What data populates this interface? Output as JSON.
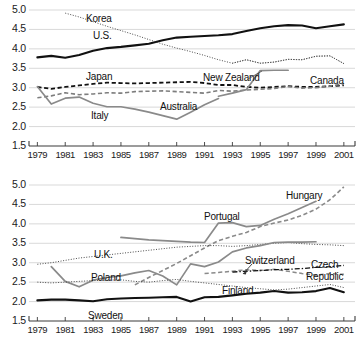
{
  "figure": {
    "width": 361,
    "height": 350,
    "background": "#ffffff",
    "panel_count": 2
  },
  "axis_style": {
    "gridline_color": "#cfcfcf",
    "axis_color": "#3a3a3a",
    "tick_color": "#3a3a3a",
    "text_color": "#1a1a1a"
  },
  "chart_data": [
    {
      "type": "line",
      "panel": "top",
      "title": "",
      "xlabel": "",
      "ylabel": "",
      "xlim": [
        1978.4,
        2001.8
      ],
      "ylim": [
        1.5,
        5.0
      ],
      "yticks": [
        "1.5",
        "2.0",
        "2.5",
        "3.0",
        "3.5",
        "4.0",
        "4.5",
        "5.0"
      ],
      "ytick_values": [
        1.5,
        2.0,
        2.5,
        3.0,
        3.5,
        4.0,
        4.5,
        5.0
      ],
      "xticks": [
        "1979",
        "1981",
        "1983",
        "1985",
        "1987",
        "1989",
        "1991",
        "1993",
        "1995",
        "1997",
        "1999",
        "2001"
      ],
      "xtick_values": [
        1979,
        1981,
        1983,
        1985,
        1987,
        1989,
        1991,
        1993,
        1995,
        1997,
        1999,
        2001
      ],
      "grid": true,
      "legend": "inline-labels",
      "series": [
        {
          "name": "U.S.",
          "style": "solid",
          "color": "#111111",
          "width": 2.1,
          "x": [
            1979,
            1980,
            1981,
            1982,
            1983,
            1984,
            1985,
            1986,
            1987,
            1988,
            1989,
            1990,
            1991,
            1992,
            1993,
            1994,
            1995,
            1996,
            1997,
            1998,
            1999,
            2000,
            2001
          ],
          "values": [
            3.78,
            3.82,
            3.77,
            3.84,
            3.95,
            4.02,
            4.05,
            4.09,
            4.13,
            4.22,
            4.29,
            4.31,
            4.33,
            4.35,
            4.38,
            4.46,
            4.53,
            4.58,
            4.61,
            4.6,
            4.53,
            4.58,
            4.63
          ]
        },
        {
          "name": "Korea",
          "style": "dotted",
          "color": "#4d4d4d",
          "width": 1.0,
          "x": [
            1981,
            1982,
            1983,
            1984,
            1985,
            1986,
            1987,
            1988,
            1989,
            1990,
            1991,
            1992,
            1993,
            1994,
            1995,
            1996,
            1997,
            1998,
            1999,
            2000,
            2001
          ],
          "values": [
            4.92,
            4.82,
            4.7,
            4.58,
            4.47,
            4.36,
            4.24,
            4.12,
            4.02,
            3.93,
            3.83,
            3.72,
            3.63,
            3.72,
            3.63,
            3.66,
            3.73,
            3.72,
            3.81,
            3.82,
            3.62
          ]
        },
        {
          "name": "Canada",
          "style": "dotted",
          "color": "#4d4d4d",
          "width": 1.0,
          "x": [
            1993,
            1994,
            1995,
            1996,
            1997,
            1998,
            1999,
            2000,
            2001
          ],
          "values": [
            3.63,
            3.72,
            3.63,
            3.66,
            3.73,
            3.72,
            3.81,
            3.82,
            3.62
          ]
        },
        {
          "name": "Japan",
          "style": "dashed",
          "color": "#111111",
          "width": 1.8,
          "x": [
            1979,
            1980,
            1981,
            1982,
            1983,
            1984,
            1985,
            1986,
            1987,
            1988,
            1989,
            1990,
            1991,
            1992,
            1993,
            1994,
            1995,
            1996,
            1997,
            1998,
            1999,
            2000,
            2001
          ],
          "values": [
            3.02,
            2.97,
            3.02,
            3.06,
            3.1,
            3.13,
            3.12,
            3.11,
            3.12,
            3.13,
            3.14,
            3.15,
            3.12,
            3.07,
            3.07,
            3.02,
            3.0,
            3.02,
            3.04,
            3.02,
            3.02,
            3.04,
            3.06
          ]
        },
        {
          "name": "Australia",
          "style": "dashed",
          "color": "#7d7d7d",
          "width": 1.6,
          "x": [
            1979,
            1980,
            1981,
            1982,
            1983,
            1984,
            1985,
            1986,
            1987,
            1988,
            1989,
            1990,
            1991,
            1992,
            1993,
            1994,
            1995,
            1996,
            1997,
            1998,
            1999,
            2000,
            2001
          ],
          "values": [
            2.74,
            2.79,
            2.87,
            2.82,
            2.84,
            2.87,
            2.86,
            2.9,
            2.91,
            2.92,
            2.9,
            2.88,
            2.86,
            2.93,
            2.91,
            2.94,
            2.96,
            2.98,
            3.03,
            2.99,
            3.0,
            3.04,
            3.1
          ]
        },
        {
          "name": "Italy",
          "style": "solid",
          "color": "#8a8a8a",
          "width": 1.7,
          "x": [
            1979,
            1980,
            1981,
            1982,
            1983,
            1984,
            1985,
            1986,
            1987,
            1988,
            1989,
            1990,
            1991,
            1992
          ],
          "values": [
            3.03,
            2.58,
            2.73,
            2.76,
            2.6,
            2.51,
            2.51,
            2.45,
            2.37,
            2.28,
            2.19,
            2.37,
            2.56,
            2.72
          ]
        },
        {
          "name": "New Zealand",
          "style": "solid",
          "color": "#8a8a8a",
          "width": 1.7,
          "x": [
            1992,
            1993,
            1994,
            1995,
            1996,
            1997
          ],
          "values": [
            2.78,
            2.86,
            2.95,
            3.44,
            3.45,
            3.45
          ]
        }
      ],
      "annotations": [
        {
          "text": "Korea",
          "x_px": 86,
          "y_px": 13
        },
        {
          "text": "U.S.",
          "x_px": 93,
          "y_px": 30
        },
        {
          "text": "Japan",
          "x_px": 86,
          "y_px": 71
        },
        {
          "text": "New Zealand",
          "x_px": 203,
          "y_px": 72
        },
        {
          "text": "Canada",
          "x_px": 310,
          "y_px": 75
        },
        {
          "text": "Australia",
          "x_px": 160,
          "y_px": 101
        },
        {
          "text": "Italy",
          "x_px": 91,
          "y_px": 110
        }
      ]
    },
    {
      "type": "line",
      "panel": "bottom",
      "title": "",
      "xlabel": "",
      "ylabel": "",
      "xlim": [
        1978.4,
        2001.8
      ],
      "ylim": [
        1.5,
        5.0
      ],
      "yticks": [
        "1.5",
        "2.0",
        "2.5",
        "3.0",
        "3.5",
        "4.0",
        "4.5",
        "5.0"
      ],
      "ytick_values": [
        1.5,
        2.0,
        2.5,
        3.0,
        3.5,
        4.0,
        4.5,
        5.0
      ],
      "xticks": [
        "1979",
        "1981",
        "1983",
        "1985",
        "1987",
        "1989",
        "1991",
        "1993",
        "1995",
        "1997",
        "1999",
        "2001"
      ],
      "xtick_values": [
        1979,
        1981,
        1983,
        1985,
        1987,
        1989,
        1991,
        1993,
        1995,
        1997,
        1999,
        2001
      ],
      "grid": true,
      "legend": "inline-labels",
      "series": [
        {
          "name": "Hungary",
          "style": "dashed",
          "color": "#8a8a8a",
          "width": 1.6,
          "x": [
            1986,
            1987,
            1988,
            1989,
            1990,
            1991,
            1992,
            1993,
            1994,
            1995,
            1996,
            1997,
            1998,
            1999,
            2000,
            2001
          ],
          "values": [
            2.43,
            2.62,
            2.8,
            2.98,
            3.18,
            3.38,
            3.57,
            3.68,
            3.78,
            3.93,
            4.02,
            4.1,
            4.22,
            4.38,
            4.62,
            4.95
          ]
        },
        {
          "name": "Portugal",
          "style": "solid",
          "color": "#8a8a8a",
          "width": 1.7,
          "x": [
            1985,
            1986,
            1987,
            1988,
            1989,
            1990,
            1991,
            1992,
            1993,
            1994,
            1995,
            1996,
            1997,
            1998,
            1999
          ],
          "values": [
            3.65,
            3.62,
            3.59,
            3.57,
            3.55,
            3.53,
            3.52,
            4.02,
            4.03,
            3.93,
            3.96,
            4.12,
            4.26,
            4.42,
            4.58
          ]
        },
        {
          "name": "U.K.",
          "style": "dotted",
          "color": "#4d4d4d",
          "width": 1.0,
          "x": [
            1979,
            1980,
            1981,
            1982,
            1983,
            1984,
            1985,
            1986,
            1987,
            1988,
            1989,
            1990,
            1991,
            1992,
            1993,
            1994,
            1995,
            1996,
            1997,
            1998,
            1999,
            2000,
            2001
          ],
          "values": [
            2.96,
            3.0,
            3.06,
            3.12,
            3.16,
            3.2,
            3.24,
            3.28,
            3.32,
            3.36,
            3.4,
            3.42,
            3.44,
            3.44,
            3.42,
            3.44,
            3.47,
            3.5,
            3.52,
            3.49,
            3.47,
            3.46,
            3.44
          ]
        },
        {
          "name": "Poland",
          "style": "solid",
          "color": "#8a8a8a",
          "width": 1.7,
          "x": [
            1980,
            1981,
            1982,
            1983,
            1984,
            1985,
            1986,
            1987,
            1988,
            1989,
            1990,
            1991,
            1992,
            1993,
            1994,
            1995,
            1996,
            1997,
            1998,
            1999
          ],
          "values": [
            2.9,
            2.52,
            2.38,
            2.55,
            2.62,
            2.66,
            2.74,
            2.8,
            2.66,
            2.43,
            2.97,
            2.9,
            3.02,
            3.28,
            3.38,
            3.44,
            3.52,
            3.53,
            3.53,
            3.54
          ]
        },
        {
          "name": "Sweden",
          "style": "solid",
          "color": "#111111",
          "width": 2.1,
          "x": [
            1979,
            1980,
            1981,
            1982,
            1983,
            1984,
            1985,
            1986,
            1987,
            1988,
            1989,
            1990,
            1991,
            1992,
            1993,
            1994,
            1995,
            1996,
            1997,
            1998,
            1999,
            2000,
            2001
          ],
          "values": [
            2.03,
            2.05,
            2.05,
            2.03,
            2.01,
            2.06,
            2.08,
            2.09,
            2.1,
            2.11,
            2.12,
            2.0,
            2.11,
            2.12,
            2.16,
            2.2,
            2.23,
            2.27,
            2.23,
            2.24,
            2.27,
            2.35,
            2.24
          ]
        },
        {
          "name": "Finland",
          "style": "dotted",
          "color": "#4d4d4d",
          "width": 1.0,
          "x": [
            1979,
            1980,
            1981,
            1982,
            1983,
            1984,
            1985,
            1986,
            1987,
            1988,
            1989,
            1990,
            1991,
            1992,
            1993,
            1994,
            1995,
            1996,
            1997,
            1998,
            1999,
            2000,
            2001
          ],
          "values": [
            2.5,
            2.48,
            2.5,
            2.52,
            2.54,
            2.55,
            2.56,
            2.52,
            2.5,
            2.54,
            2.57,
            2.52,
            2.48,
            2.44,
            2.4,
            2.36,
            2.33,
            2.3,
            2.32,
            2.36,
            2.4,
            2.44,
            2.36
          ]
        },
        {
          "name": "Switzerland",
          "style": "dashed",
          "color": "#8a8a8a",
          "width": 1.5,
          "x": [
            1991,
            1992,
            1993,
            1994,
            1995,
            1996,
            1997,
            1998,
            1999,
            2000,
            2001
          ],
          "values": [
            2.72,
            2.75,
            2.78,
            2.82,
            2.8,
            2.83,
            2.78,
            2.72,
            2.68,
            2.72,
            2.7
          ]
        },
        {
          "name": "Czech Republic",
          "style": "dashdot",
          "color": "#111111",
          "width": 1.3,
          "x": [
            1993,
            1994,
            1995,
            1996,
            1997,
            1998,
            1999,
            2000,
            2001
          ],
          "values": [
            2.76,
            2.78,
            2.8,
            2.82,
            2.83,
            2.85,
            2.88,
            2.9,
            2.93
          ]
        }
      ],
      "annotations": [
        {
          "text": "Hungary",
          "x_px": 286,
          "y_px": 190
        },
        {
          "text": "Portugal",
          "x_px": 204,
          "y_px": 211
        },
        {
          "text": "U.K.",
          "x_px": 94,
          "y_px": 249
        },
        {
          "text": "Poland",
          "x_px": 91,
          "y_px": 272
        },
        {
          "text": "Switzerland",
          "x_px": 245,
          "y_px": 255
        },
        {
          "text": "Czech",
          "x_px": 311,
          "y_px": 259
        },
        {
          "text": "Republic",
          "x_px": 306,
          "y_px": 271
        },
        {
          "text": "Finland",
          "x_px": 222,
          "y_px": 285
        },
        {
          "text": "Sweden",
          "x_px": 88,
          "y_px": 310
        }
      ]
    }
  ]
}
